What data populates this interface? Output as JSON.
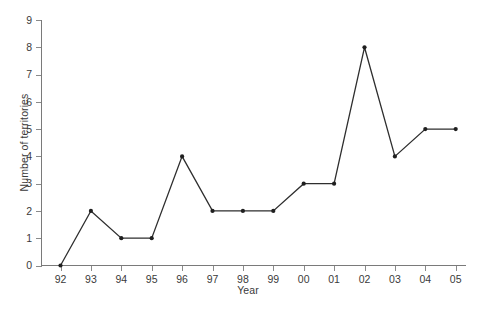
{
  "chart_data": {
    "type": "line",
    "title": "",
    "xlabel": "Year",
    "ylabel": "Number of territories",
    "categories": [
      "92",
      "93",
      "94",
      "95",
      "96",
      "97",
      "98",
      "99",
      "00",
      "01",
      "02",
      "03",
      "04",
      "05"
    ],
    "values": [
      0,
      2,
      1,
      1,
      4,
      2,
      2,
      2,
      3,
      3,
      8,
      4,
      5,
      5
    ],
    "x_tick_labels": [
      "92",
      "93",
      "94",
      "95",
      "96",
      "97",
      "98",
      "99",
      "00",
      "01",
      "02",
      "03",
      "04",
      "05"
    ],
    "y_tick_labels": [
      "0",
      "1",
      "2",
      "3",
      "4",
      "5",
      "6",
      "7",
      "8",
      "9"
    ],
    "y_ticks": [
      0,
      1,
      2,
      3,
      4,
      5,
      6,
      7,
      8,
      9
    ],
    "ylim": [
      0,
      9
    ],
    "grid": false,
    "legend": null,
    "series": [
      {
        "name": "Number of territories",
        "values": [
          0,
          2,
          1,
          1,
          4,
          2,
          2,
          2,
          3,
          3,
          8,
          4,
          5,
          5
        ],
        "line_color": "#2e2e2e",
        "marker": "circle",
        "marker_color": "#1f1f1f"
      }
    ]
  },
  "style": {
    "background": "#ffffff",
    "axis_color": "#7a7a7a",
    "tick_color": "#8a8a8a",
    "text_color": "#3a3a3a",
    "line_color": "#2e2e2e"
  }
}
